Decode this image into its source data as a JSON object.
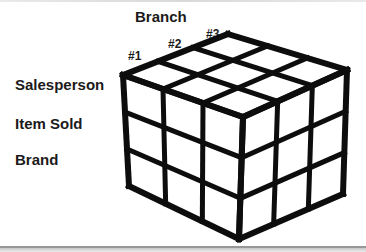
{
  "diagram": {
    "type": "data-cube",
    "top_axis": {
      "label": "Branch",
      "ticks": [
        "#1",
        "#2",
        "#3"
      ]
    },
    "side_labels": [
      "Salesperson",
      "Item Sold",
      "Brand"
    ],
    "cube": {
      "rows": 3,
      "columns": 3,
      "depth": 3,
      "visible_faces": [
        "top",
        "front-left",
        "front-right"
      ]
    },
    "colors": {
      "line": "#0d0d0d",
      "text": "#1c1a1a",
      "background": "#ffffff",
      "bottom_bar": "#c6c6c6",
      "bottom_bar_edge": "#979797"
    }
  }
}
